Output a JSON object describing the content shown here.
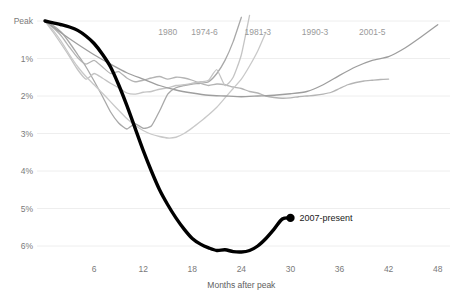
{
  "chart_data": {
    "type": "line",
    "title": "",
    "subtitle": "",
    "xlabel": "Months after peak",
    "ylabel": "",
    "xlim": [
      0,
      49.5
    ],
    "ylim": [
      6.55,
      -0.35
    ],
    "grid": true,
    "legend_position": "inline-labels",
    "x_ticks": [
      6,
      12,
      18,
      24,
      30,
      36,
      42,
      48
    ],
    "x_tick_labels": [
      "6",
      "12",
      "18",
      "24",
      "30",
      "36",
      "42",
      "48"
    ],
    "y_ticks": [
      0,
      1,
      2,
      3,
      4,
      5,
      6
    ],
    "y_tick_labels": [
      "Peak",
      "1%",
      "2%",
      "3%",
      "4%",
      "5%",
      "6%"
    ],
    "value_note": "Percent job losses relative to employment peak",
    "series": [
      {
        "name": "1980",
        "label": "1980",
        "color": "#a8a8a8",
        "width": 1.3,
        "label_x": 15.0,
        "label_y": 0.28,
        "x": [
          0,
          1,
          2,
          3,
          4,
          5,
          6,
          7,
          8,
          9,
          10,
          11,
          12,
          13,
          14,
          15,
          16,
          17,
          18,
          19,
          20,
          21,
          22,
          23,
          24
        ],
        "values": [
          0,
          0.12,
          0.3,
          0.58,
          0.9,
          1.22,
          1.6,
          2.0,
          2.42,
          2.72,
          2.88,
          2.74,
          2.86,
          2.8,
          2.4,
          1.95,
          1.78,
          1.72,
          1.68,
          1.66,
          1.62,
          1.4,
          1.05,
          0.55,
          -0.1
        ]
      },
      {
        "name": "1974-6",
        "label": "1974-6",
        "color": "#b4b4b4",
        "width": 1.3,
        "label_x": 19.5,
        "label_y": 0.28,
        "x": [
          0,
          1,
          2,
          3,
          4,
          5,
          6,
          7,
          8,
          9,
          10,
          11,
          12,
          13,
          14,
          15,
          16,
          17,
          18,
          19,
          20,
          21,
          22,
          23,
          24,
          25,
          26,
          27,
          28,
          29,
          30,
          31,
          32,
          33,
          34,
          35,
          36,
          37,
          38,
          39,
          40,
          41,
          42
        ],
        "values": [
          0,
          0.18,
          0.4,
          0.7,
          0.98,
          1.15,
          1.05,
          1.22,
          1.4,
          1.35,
          1.52,
          1.62,
          1.58,
          1.52,
          1.48,
          1.55,
          1.5,
          1.52,
          1.58,
          1.66,
          1.72,
          1.68,
          1.7,
          1.76,
          1.8,
          1.88,
          1.92,
          2.0,
          2.04,
          2.06,
          2.05,
          2.02,
          2.0,
          1.98,
          1.95,
          1.9,
          1.8,
          1.7,
          1.64,
          1.6,
          1.58,
          1.56,
          1.55
        ]
      },
      {
        "name": "1981-3",
        "label": "1981-3",
        "color": "#c4c4c4",
        "width": 1.3,
        "label_x": 26.0,
        "label_y": 0.28,
        "x": [
          0,
          1,
          2,
          3,
          4,
          5,
          6,
          7,
          8,
          9,
          10,
          11,
          12,
          13,
          14,
          15,
          16,
          17,
          18,
          19,
          20,
          21,
          22,
          23,
          24,
          25
        ],
        "values": [
          0,
          0.3,
          0.62,
          0.95,
          1.3,
          1.55,
          1.4,
          1.52,
          1.66,
          1.78,
          1.92,
          1.95,
          1.9,
          1.88,
          1.82,
          1.78,
          1.72,
          1.7,
          1.66,
          1.62,
          1.58,
          1.3,
          1.72,
          1.5,
          0.9,
          -0.15
        ]
      },
      {
        "name": "1990-3",
        "label": "1990-3",
        "color": "#c9c9c9",
        "width": 1.3,
        "label_x": 33.0,
        "label_y": 0.28,
        "x": [
          0,
          1,
          2,
          3,
          4,
          5,
          6,
          7,
          8,
          9,
          10,
          11,
          12,
          13,
          14,
          15,
          16,
          17,
          18,
          19,
          20,
          21,
          22,
          23,
          24,
          25,
          26,
          27
        ],
        "values": [
          0,
          0.25,
          0.55,
          0.9,
          1.22,
          1.48,
          1.7,
          1.92,
          2.15,
          2.38,
          2.6,
          2.78,
          2.92,
          3.02,
          3.08,
          3.12,
          3.1,
          3.0,
          2.85,
          2.68,
          2.5,
          2.3,
          2.05,
          1.8,
          1.55,
          1.2,
          0.8,
          0.3
        ]
      },
      {
        "name": "2001-5",
        "label": "2001-5",
        "color": "#9e9e9e",
        "width": 1.3,
        "label_x": 40.0,
        "label_y": 0.28,
        "x": [
          0,
          2,
          4,
          6,
          8,
          10,
          12,
          14,
          16,
          18,
          20,
          22,
          24,
          26,
          28,
          30,
          32,
          34,
          36,
          38,
          40,
          42,
          44,
          46,
          48
        ],
        "values": [
          0,
          0.32,
          0.62,
          0.9,
          1.15,
          1.38,
          1.55,
          1.72,
          1.84,
          1.92,
          1.98,
          2.0,
          2.02,
          2.0,
          1.98,
          1.94,
          1.88,
          1.7,
          1.45,
          1.22,
          1.05,
          0.95,
          0.72,
          0.42,
          0.1
        ]
      },
      {
        "name": "2007-present",
        "label": "2007-present",
        "color": "#000000",
        "width": 3.4,
        "current": true,
        "endpoint_marker": true,
        "label_x": 31.0,
        "label_y": 5.2,
        "x": [
          0,
          1,
          2,
          3,
          4,
          5,
          6,
          7,
          8,
          9,
          10,
          11,
          12,
          13,
          14,
          15,
          16,
          17,
          18,
          19,
          20,
          21,
          22,
          23,
          24,
          25,
          26,
          27,
          28,
          29,
          30
        ],
        "values": [
          0,
          0.05,
          0.1,
          0.16,
          0.25,
          0.4,
          0.6,
          0.88,
          1.22,
          1.7,
          2.25,
          2.85,
          3.45,
          4.0,
          4.5,
          4.9,
          5.25,
          5.55,
          5.8,
          5.95,
          6.05,
          6.12,
          6.1,
          6.15,
          6.16,
          6.12,
          6.0,
          5.8,
          5.55,
          5.28,
          5.25
        ]
      }
    ]
  },
  "labels": {
    "x_axis_title": "Months after peak",
    "y_peak": "Peak",
    "current_series": "2007-present"
  }
}
